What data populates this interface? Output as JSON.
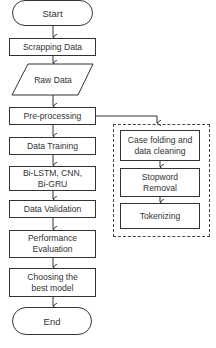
{
  "flowchart": {
    "main": {
      "start": "Start",
      "scrapping": "Scrapping Data",
      "raw_data": "Raw Data",
      "preprocessing": "Pre-processing",
      "training": "Data Training",
      "models": "Bi-LSTM, CNN, Bi-GRU",
      "validation": "Data Validation",
      "evaluation": "Performance Evaluation",
      "choosing": "Choosing the best model",
      "end": "End"
    },
    "preprocessing_steps": {
      "case_folding": "Case folding and data cleaning",
      "stopword": "Stopword Removal",
      "tokenizing": "Tokenizing"
    }
  },
  "colors": {
    "stroke": "#333333",
    "background": "#ffffff"
  }
}
